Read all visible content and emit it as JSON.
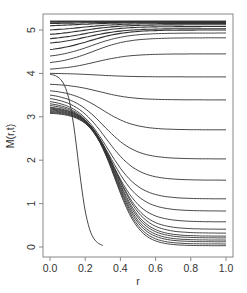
{
  "chart_data": {
    "type": "line",
    "title": "",
    "xlabel": "r",
    "ylabel": "M(r,t)",
    "xlim": [
      0.0,
      1.0
    ],
    "ylim": [
      0,
      5.2
    ],
    "xticks": [
      "0.0",
      "0.2",
      "0.4",
      "0.6",
      "0.8",
      "1.0"
    ],
    "yticks": [
      "0",
      "1",
      "2",
      "3",
      "4",
      "5"
    ],
    "grid": false,
    "legend": null,
    "line_color": "#333333",
    "right_end_values_at_r1": [
      5.2,
      5.2,
      5.19,
      5.18,
      5.17,
      5.15,
      5.12,
      5.08,
      5.03,
      5.0,
      4.93,
      4.82,
      4.45,
      3.92,
      3.39,
      2.7,
      2.03,
      1.54,
      1.11,
      0.83,
      0.58,
      0.41,
      0.32,
      0.25,
      0.21,
      0.16,
      0.12,
      0.07,
      0.03
    ],
    "left_start_values_at_r0": [
      5.2,
      5.2,
      5.18,
      5.15,
      5.1,
      5.0,
      4.9,
      4.8,
      4.7,
      4.55,
      4.4,
      4.25,
      4.1,
      4.0,
      3.75,
      3.6,
      3.5,
      3.42,
      3.35,
      3.3,
      3.26,
      3.22,
      3.2,
      3.18,
      3.16,
      3.14,
      3.12,
      3.1,
      3.08
    ]
  },
  "axes": {
    "xlabel": "r",
    "ylabel": "M(r,t)",
    "xticks": [
      "0.0",
      "0.2",
      "0.4",
      "0.6",
      "0.8",
      "1.0"
    ],
    "yticks": [
      "0",
      "1",
      "2",
      "3",
      "4",
      "5"
    ]
  }
}
